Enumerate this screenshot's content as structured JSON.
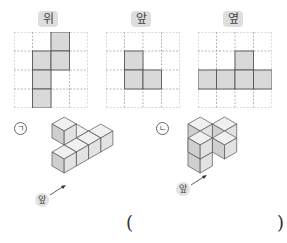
{
  "views": [
    {
      "label": "위",
      "filled": [
        [
          2,
          0
        ],
        [
          1,
          1
        ],
        [
          2,
          1
        ],
        [
          1,
          2
        ],
        [
          1,
          3
        ]
      ]
    },
    {
      "label": "앞",
      "filled": [
        [
          1,
          1
        ],
        [
          1,
          2
        ],
        [
          2,
          2
        ]
      ]
    },
    {
      "label": "옆",
      "filled": [
        [
          2,
          1
        ],
        [
          0,
          2
        ],
        [
          1,
          2
        ],
        [
          2,
          2
        ],
        [
          3,
          2
        ]
      ]
    }
  ],
  "grid": {
    "rows": 4,
    "cols": 4
  },
  "figures": [
    {
      "marker": "ㄱ",
      "front_label": "앞"
    },
    {
      "marker": "ㄴ",
      "front_label": "앞"
    }
  ],
  "answer": {
    "open": "(",
    "close": ")",
    "value": ""
  },
  "colors": {
    "fill": "#d9d9d9",
    "stroke": "#555555",
    "grid": "#999999",
    "badge": "#dedede"
  }
}
